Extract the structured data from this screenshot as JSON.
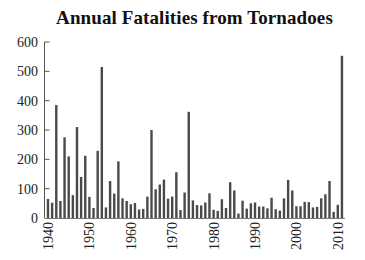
{
  "chart_data": {
    "type": "bar",
    "title": "Annual Fatalities from Tornadoes",
    "xlabel": "",
    "ylabel": "",
    "ylim": [
      0,
      600
    ],
    "yticks": [
      0,
      100,
      200,
      300,
      400,
      500,
      600
    ],
    "xticks": [
      1940,
      1950,
      1960,
      1970,
      1980,
      1990,
      2000,
      2010
    ],
    "grid": false,
    "legend": null,
    "bar_color": "#4a4a4a",
    "categories": [
      1940,
      1941,
      1942,
      1943,
      1944,
      1945,
      1946,
      1947,
      1948,
      1949,
      1950,
      1951,
      1952,
      1953,
      1954,
      1955,
      1956,
      1957,
      1958,
      1959,
      1960,
      1961,
      1962,
      1963,
      1964,
      1965,
      1966,
      1967,
      1968,
      1969,
      1970,
      1971,
      1972,
      1973,
      1974,
      1975,
      1976,
      1977,
      1978,
      1979,
      1980,
      1981,
      1982,
      1983,
      1984,
      1985,
      1986,
      1987,
      1988,
      1989,
      1990,
      1991,
      1992,
      1993,
      1994,
      1995,
      1996,
      1997,
      1998,
      1999,
      2000,
      2001,
      2002,
      2003,
      2004,
      2005,
      2006,
      2007,
      2008,
      2009,
      2010,
      2011
    ],
    "values": [
      65,
      52,
      385,
      58,
      275,
      210,
      78,
      310,
      140,
      212,
      72,
      34,
      229,
      515,
      36,
      126,
      83,
      193,
      67,
      58,
      47,
      51,
      29,
      31,
      73,
      300,
      98,
      114,
      131,
      66,
      73,
      156,
      27,
      87,
      362,
      60,
      44,
      43,
      53,
      84,
      28,
      24,
      64,
      34,
      122,
      94,
      15,
      59,
      32,
      50,
      53,
      39,
      39,
      33,
      69,
      30,
      25,
      67,
      130,
      94,
      40,
      40,
      55,
      54,
      36,
      38,
      67,
      81,
      126,
      21,
      45,
      553
    ]
  }
}
